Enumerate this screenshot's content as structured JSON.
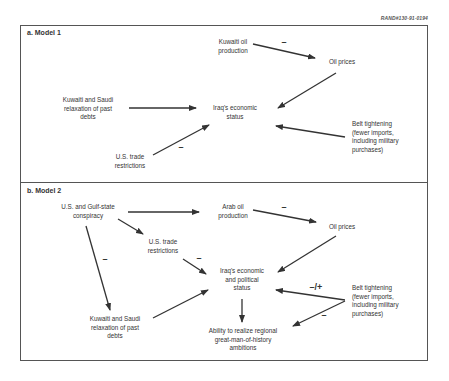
{
  "figure_ref": "RAND#130-91-0194",
  "model1": {
    "title": "a.  Model 1",
    "nodes": {
      "kuwaiti_oil": [
        "Kuwaiti oil",
        "production"
      ],
      "oil_prices": [
        "Oil prices"
      ],
      "relaxation": [
        "Kuwaiti and Saudi",
        "relaxation of past",
        "debts"
      ],
      "iraq_status": [
        "Iraq's economic",
        "status"
      ],
      "us_trade": [
        "U.S. trade",
        "restrictions"
      ],
      "belt": [
        "Belt tightening",
        "(fewer imports,",
        "including military",
        "purchases)"
      ]
    },
    "signs": {
      "oil_to_prices": "–",
      "trade_to_iraq": "–"
    }
  },
  "model2": {
    "title": "b.  Model 2",
    "nodes": {
      "conspiracy": [
        "U.S. and Gulf-state",
        "conspiracy"
      ],
      "arab_oil": [
        "Arab oil",
        "production"
      ],
      "oil_prices": [
        "Oil prices"
      ],
      "us_trade": [
        "U.S. trade",
        "restrictions"
      ],
      "iraq_status": [
        "Iraq's economic",
        "and political",
        "status"
      ],
      "relaxation": [
        "Kuwaiti and Saudi",
        "relaxation of past",
        "debts"
      ],
      "ability": [
        "Ability to realize regional",
        "great-man-of-history",
        "ambitions"
      ],
      "belt": [
        "Belt tightening",
        "(fewer imports,",
        "including military",
        "purchases)"
      ]
    },
    "signs": {
      "oil_to_prices": "–",
      "conspiracy_to_relaxation": "–",
      "trade_to_iraq": "–",
      "belt_to_iraq": "–/+",
      "belt_to_ability": "–"
    }
  }
}
